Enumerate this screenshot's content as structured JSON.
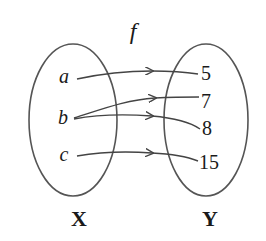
{
  "function_label": "f",
  "domain_set": {
    "name": "X",
    "elements": [
      "a",
      "b",
      "c"
    ]
  },
  "codomain_set": {
    "name": "Y",
    "elements": [
      "5",
      "7",
      "8",
      "15"
    ]
  },
  "mappings": [
    {
      "from": "a",
      "to": "5"
    },
    {
      "from": "b",
      "to": "7"
    },
    {
      "from": "b",
      "to": "8"
    },
    {
      "from": "c",
      "to": "15"
    }
  ],
  "colors": {
    "stroke": "#555555",
    "text": "#1a1a1a",
    "background": "#ffffff"
  }
}
